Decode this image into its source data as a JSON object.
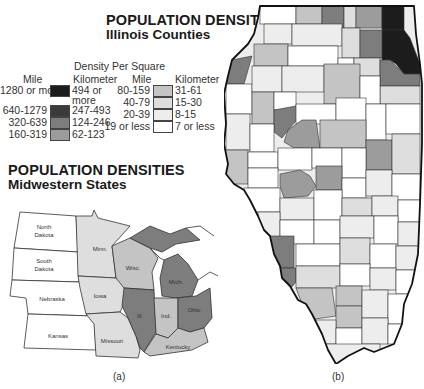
{
  "titles": {
    "illinois": {
      "line1": "POPULATION DENSITIES",
      "line2": "Illinois Counties"
    },
    "midwest": {
      "line1": "POPULATION DENSITIES",
      "line2": "Midwestern States"
    }
  },
  "legend": {
    "header": "Density Per Square",
    "col_mile": "Mile",
    "col_km": "Kilometer",
    "classes": [
      {
        "mile": "1280 or more",
        "km": "494 or more",
        "color": "#1c1c1c"
      },
      {
        "mile": "640-1279",
        "km": "247-493",
        "color": "#3a3a3a"
      },
      {
        "mile": "320-639",
        "km": "124-246",
        "color": "#7d7d7d"
      },
      {
        "mile": "160-319",
        "km": "62-123",
        "color": "#9c9c9c"
      },
      {
        "mile": "80-159",
        "km": "31-61",
        "color": "#c4c4c4"
      },
      {
        "mile": "40-79",
        "km": "15-30",
        "color": "#dedede"
      },
      {
        "mile": "20-39",
        "km": "8-15",
        "color": "#ededed"
      },
      {
        "mile": "19 or less",
        "km": "7 or less",
        "color": "#ffffff"
      }
    ]
  },
  "midwest_map": {
    "states": [
      {
        "name": "North Dakota",
        "label1": "North",
        "label2": "Dakota",
        "density_class": 7
      },
      {
        "name": "South Dakota",
        "label1": "South",
        "label2": "Dakota",
        "density_class": 7
      },
      {
        "name": "Nebraska",
        "label1": "Nebraska",
        "label2": "",
        "density_class": 7
      },
      {
        "name": "Kansas",
        "label1": "Kansas",
        "label2": "",
        "density_class": 7
      },
      {
        "name": "Minnesota",
        "label1": "Minn.",
        "label2": "",
        "density_class": 5
      },
      {
        "name": "Iowa",
        "label1": "Iowa",
        "label2": "",
        "density_class": 5
      },
      {
        "name": "Missouri",
        "label1": "Missouri",
        "label2": "",
        "density_class": 5
      },
      {
        "name": "Wisconsin",
        "label1": "Wisc.",
        "label2": "",
        "density_class": 4
      },
      {
        "name": "Illinois",
        "label1": "Ill.",
        "label2": "",
        "density_class": 2
      },
      {
        "name": "Indiana",
        "label1": "Ind.",
        "label2": "",
        "density_class": 4
      },
      {
        "name": "Michigan",
        "label1": "Mich.",
        "label2": "",
        "density_class": 2
      },
      {
        "name": "Ohio",
        "label1": "Ohio",
        "label2": "",
        "density_class": 2
      },
      {
        "name": "Kentucky",
        "label1": "Kentucky",
        "label2": "",
        "density_class": 4
      }
    ],
    "caption": "(a)"
  },
  "illinois_map": {
    "caption": "(b)"
  }
}
